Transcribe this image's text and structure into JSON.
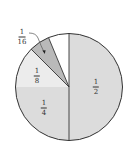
{
  "chart_data": {
    "type": "pie",
    "title": "",
    "start_angle_deg": 0,
    "direction": "clockwise",
    "slices": [
      {
        "label": "1/2",
        "numerator": "1",
        "denominator": "2",
        "value": 0.5,
        "color": "#dcdcdc",
        "labeled": true
      },
      {
        "label": "1/4",
        "numerator": "1",
        "denominator": "4",
        "value": 0.25,
        "color": "#dcdcdc",
        "labeled": true
      },
      {
        "label": "1/8",
        "numerator": "1",
        "denominator": "8",
        "value": 0.125,
        "color": "#ececec",
        "labeled": true
      },
      {
        "label": "1/16",
        "numerator": "1",
        "denominator": "16",
        "value": 0.0625,
        "color": "#b9b9b9",
        "labeled": true,
        "callout": true
      },
      {
        "label": "",
        "numerator": "",
        "denominator": "",
        "value": 0.0625,
        "color": "#ffffff",
        "labeled": false
      }
    ],
    "legend": "none",
    "grid": false
  },
  "labels": {
    "half": {
      "num": "1",
      "den": "2"
    },
    "quarter": {
      "num": "1",
      "den": "4"
    },
    "eighth": {
      "num": "1",
      "den": "8"
    },
    "sixteenth": {
      "num": "1",
      "den": "16"
    }
  },
  "colors": {
    "outline": "#333333",
    "text": "#333333"
  }
}
